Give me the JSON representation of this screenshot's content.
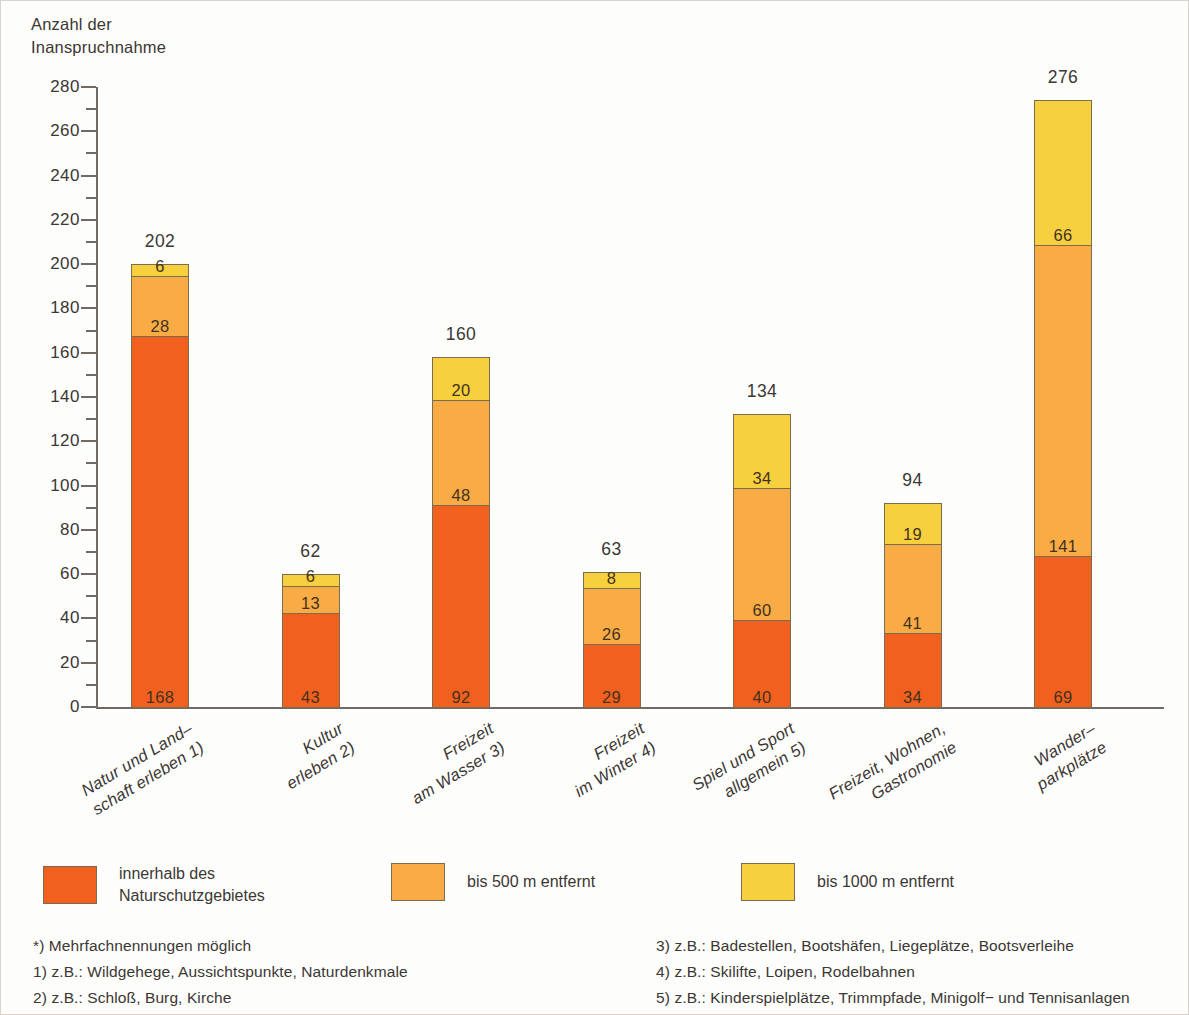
{
  "chart_data": {
    "type": "bar",
    "subtype": "stacked",
    "title": "",
    "ylabel": "Anzahl der\nInanspruchnahme",
    "xlabel": "",
    "ylim": [
      0,
      280
    ],
    "ytick_step": 20,
    "yminor_step": 10,
    "grid": false,
    "legend_position": "bottom",
    "ytick_labels": [
      "0",
      "20",
      "40",
      "60",
      "80",
      "100",
      "120",
      "140",
      "160",
      "180",
      "200",
      "220",
      "240",
      "260",
      "280"
    ],
    "categories": [
      "Natur und Land–\nschaft erleben 1)",
      "Kultur\nerleben 2)",
      "Freizeit\nam Wasser 3)",
      "Freizeit\nim Winter 4)",
      "Spiel und Sport\nallgemein 5)",
      "Freizeit, Wohnen,\nGastronomie",
      "Wander–\nparkplätze"
    ],
    "series": [
      {
        "name": "innerhalb des\nNaturschutzgebietes",
        "color": "#f2601f",
        "values": [
          168,
          43,
          92,
          29,
          40,
          34,
          69
        ]
      },
      {
        "name": "bis 500 m entfernt",
        "color": "#f9ab45",
        "values": [
          28,
          13,
          48,
          26,
          60,
          41,
          141
        ]
      },
      {
        "name": "bis 1000 m entfernt",
        "color": "#f7d03f",
        "values": [
          6,
          6,
          20,
          8,
          34,
          19,
          66
        ]
      }
    ],
    "totals": [
      202,
      62,
      160,
      63,
      134,
      94,
      276
    ]
  },
  "legend": {
    "items": [
      {
        "label": "innerhalb des\nNaturschutzgebietes",
        "color": "#f2601f"
      },
      {
        "label": "bis 500 m entfernt",
        "color": "#f9ab45"
      },
      {
        "label": "bis 1000 m entfernt",
        "color": "#f7d03f"
      }
    ]
  },
  "footnotes": {
    "left": [
      "*) Mehrfachnennungen möglich",
      "1) z.B.: Wildgehege, Aussichtspunkte, Naturdenkmale",
      "2) z.B.: Schloß, Burg, Kirche"
    ],
    "right": [
      "3) z.B.: Badestellen, Bootshäfen, Liegeplätze, Bootsverleihe",
      "4) z.B.: Skilifte, Loipen, Rodelbahnen",
      "5) z.B.: Kinderspielplätze, Trimmpfade, Minigolf− und Tennisanlagen"
    ]
  }
}
